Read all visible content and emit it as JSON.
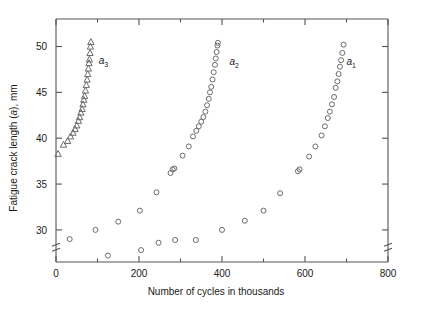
{
  "chart_data": {
    "type": "scatter",
    "title": "",
    "xlabel": "Number of cycles in thousands",
    "ylabel": "Fatigue crack length (a), mm",
    "ylabel_parts": {
      "prefix": "Fatigue crack length (",
      "italic": "a",
      "suffix": "), mm"
    },
    "xlim": [
      0,
      800
    ],
    "ylim": [
      26.5,
      53.0
    ],
    "xticks": [
      0,
      200,
      400,
      600,
      800
    ],
    "xtick_labels": [
      "0",
      "200",
      "400",
      "600",
      "800"
    ],
    "xminor_ticks": [
      100,
      300,
      500,
      700
    ],
    "yticks": [
      30,
      35,
      40,
      45,
      50
    ],
    "ytick_labels": [
      "30",
      "35",
      "40",
      "45",
      "50"
    ],
    "grid": false,
    "legend": "inline-annotations",
    "axis_break_y": true,
    "axis_break_x_right": true,
    "marker_colors": {
      "stroke": "#6b6b6b",
      "fill": "none"
    },
    "axis_color": "#545454",
    "text_color": "#1a1a1a",
    "series": [
      {
        "name": "a_1",
        "label": "a",
        "label_sub": "1",
        "marker": "circle",
        "label_x": 700,
        "label_y": 48.0,
        "points": [
          [
            400.0,
            30.0
          ],
          [
            455.0,
            31.0
          ],
          [
            500.0,
            32.1
          ],
          [
            540.0,
            34.0
          ],
          [
            583.0,
            36.4
          ],
          [
            587.0,
            36.6
          ],
          [
            610.0,
            38.0
          ],
          [
            625.0,
            39.1
          ],
          [
            640.0,
            40.3
          ],
          [
            648.0,
            41.3
          ],
          [
            655.0,
            42.2
          ],
          [
            660.0,
            42.9
          ],
          [
            665.0,
            43.7
          ],
          [
            670.0,
            44.5
          ],
          [
            674.0,
            45.5
          ],
          [
            678.0,
            46.2
          ],
          [
            681.0,
            47.0
          ],
          [
            684.0,
            47.8
          ],
          [
            687.0,
            48.5
          ],
          [
            690.0,
            49.3
          ],
          [
            693.0,
            50.2
          ]
        ]
      },
      {
        "name": "a_2",
        "label": "a",
        "label_sub": "2",
        "marker": "circle",
        "label_x": 418,
        "label_y": 48.0,
        "points": [
          [
            125.0,
            27.2
          ],
          [
            205.0,
            27.8
          ],
          [
            247.0,
            28.6
          ],
          [
            287.0,
            28.9
          ],
          [
            337.0,
            28.9
          ],
          [
            276.0,
            36.2
          ],
          [
            281.0,
            36.6
          ],
          [
            285.0,
            36.7
          ],
          [
            305.0,
            38.1
          ],
          [
            320.0,
            39.1
          ],
          [
            330.0,
            40.2
          ],
          [
            338.0,
            40.8
          ],
          [
            344.0,
            41.3
          ],
          [
            350.0,
            41.8
          ],
          [
            355.0,
            42.3
          ],
          [
            360.0,
            42.9
          ],
          [
            364.0,
            43.6
          ],
          [
            368.0,
            44.3
          ],
          [
            371.0,
            45.0
          ],
          [
            374.0,
            45.6
          ],
          [
            377.0,
            46.4
          ],
          [
            380.0,
            47.2
          ],
          [
            383.0,
            48.0
          ],
          [
            385.0,
            48.7
          ],
          [
            387.0,
            49.4
          ],
          [
            389.0,
            50.1
          ],
          [
            390.0,
            50.4
          ]
        ]
      },
      {
        "name": "a_3",
        "label": "a",
        "label_sub": "3",
        "marker": "triangle",
        "label_x": 103,
        "label_y": 48.1,
        "points": [
          [
            5.0,
            38.3
          ],
          [
            18.0,
            39.3
          ],
          [
            28.0,
            39.7
          ],
          [
            35.0,
            40.2
          ],
          [
            41.0,
            40.6
          ],
          [
            46.0,
            41.0
          ],
          [
            50.0,
            41.4
          ],
          [
            54.0,
            41.9
          ],
          [
            57.0,
            42.3
          ],
          [
            60.0,
            42.8
          ],
          [
            63.0,
            43.2
          ],
          [
            65.0,
            43.7
          ],
          [
            67.0,
            44.2
          ],
          [
            69.0,
            44.6
          ],
          [
            71.0,
            45.2
          ],
          [
            73.0,
            45.8
          ],
          [
            75.0,
            46.4
          ],
          [
            76.5,
            47.0
          ],
          [
            78.0,
            47.6
          ],
          [
            79.5,
            48.2
          ],
          [
            80.5,
            48.6
          ],
          [
            82.0,
            49.3
          ],
          [
            83.0,
            50.0
          ],
          [
            84.0,
            50.5
          ]
        ]
      },
      {
        "name": "low-scatter",
        "label": "",
        "label_sub": "",
        "marker": "circle",
        "label_x": 0,
        "label_y": 0,
        "points": [
          [
            33.0,
            29.0
          ],
          [
            95.0,
            30.0
          ],
          [
            150.0,
            30.9
          ],
          [
            202.0,
            32.1
          ],
          [
            242.0,
            34.1
          ]
        ]
      }
    ]
  }
}
